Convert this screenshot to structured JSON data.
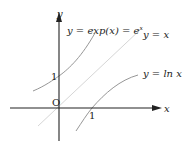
{
  "diagram": {
    "axes": {
      "x_label": "x",
      "y_label": "y",
      "origin_label": "O",
      "x_tick_label": "1",
      "y_tick_label": "1"
    },
    "curves": [
      {
        "name": "exp",
        "label": "y = exp(x) = e",
        "superscript": "x",
        "color": "#888888"
      },
      {
        "name": "identity",
        "label": "y = x",
        "color": "#d4d4d4"
      },
      {
        "name": "ln",
        "label": "y = ln x",
        "color": "#888888"
      }
    ],
    "colors": {
      "axis": "#222222"
    }
  }
}
